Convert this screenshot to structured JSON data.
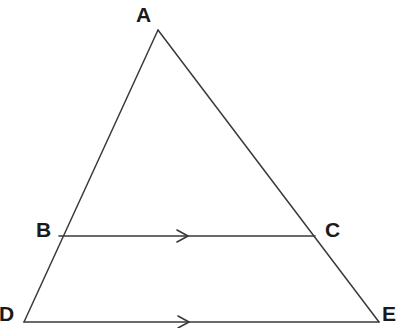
{
  "figure": {
    "kind": "geometry-diagram",
    "background_color": "#ffffff",
    "stroke_color": "#3a3a3a",
    "stroke_width": 1.5,
    "label_color": "#1a1a1a",
    "width": 397,
    "height": 328
  },
  "points": {
    "A": {
      "label": "A",
      "x": 158,
      "y": 30
    },
    "B": {
      "label": "B",
      "x": 59,
      "y": 236
    },
    "C": {
      "label": "C",
      "x": 315,
      "y": 236
    },
    "D": {
      "label": "D",
      "x": 24,
      "y": 322
    },
    "E": {
      "label": "E",
      "x": 379,
      "y": 322
    }
  },
  "segments": [
    {
      "name": "side-AD",
      "from": "A",
      "to": "D",
      "x1": 158,
      "y1": 30,
      "x2": 24,
      "y2": 322,
      "marker": "none"
    },
    {
      "name": "side-AE",
      "from": "A",
      "to": "E",
      "x1": 158,
      "y1": 30,
      "x2": 379,
      "y2": 322,
      "marker": "none"
    },
    {
      "name": "segment-BC",
      "from": "B",
      "to": "C",
      "x1": 59,
      "y1": 236,
      "x2": 315,
      "y2": 236,
      "marker": "single-chevron"
    },
    {
      "name": "base-DE",
      "from": "D",
      "to": "E",
      "x1": 24,
      "y1": 322,
      "x2": 379,
      "y2": 322,
      "marker": "single-chevron"
    }
  ],
  "markers": [
    {
      "name": "parallel-arrow-bc",
      "on": "segment-BC",
      "x": 185,
      "y": 236,
      "direction": "right"
    },
    {
      "name": "parallel-arrow-de",
      "on": "base-DE",
      "x": 186,
      "y": 322,
      "direction": "right"
    }
  ]
}
